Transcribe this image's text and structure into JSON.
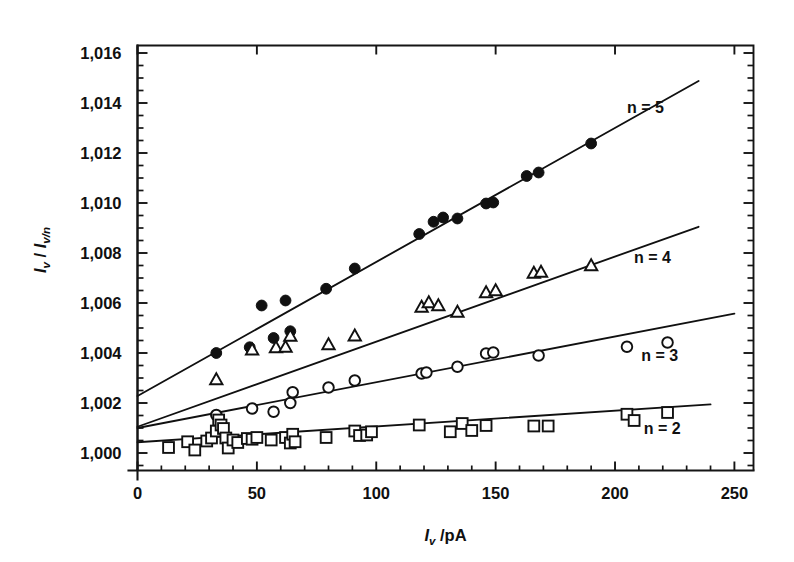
{
  "figure": {
    "background_color": "#ffffff",
    "ink_color": "#111111"
  },
  "axes": {
    "x_title": "I_v /pA",
    "x_title_parts": {
      "symbol": "I",
      "subscript": "v",
      "rest": "/pA"
    },
    "y_title": "I_v / I_v/n",
    "y_title_parts": {
      "symbol_a": "I",
      "sub_a": "v",
      "slash": "/",
      "symbol_b": "I",
      "sub_b": "v/n"
    },
    "x_ticklabels": [
      "0",
      "50",
      "100",
      "150",
      "200",
      "250"
    ],
    "x_tickvalues": [
      0,
      50,
      100,
      150,
      200,
      250
    ],
    "x_minor_step": 10,
    "xlim": [
      0,
      258
    ],
    "y_ticklabels": [
      "1,000",
      "1,002",
      "1,004",
      "1,006",
      "1,008",
      "1,010",
      "1,012",
      "1,014",
      "1,016"
    ],
    "y_tickvalues": [
      1.0,
      1.002,
      1.004,
      1.006,
      1.008,
      1.01,
      1.012,
      1.014,
      1.016
    ],
    "y_minor_step": 0.0005,
    "ylim": [
      0.9993,
      1.0163
    ],
    "decimal_separator": ","
  },
  "chart_data": {
    "type": "scatter",
    "title": "",
    "xlabel": "I_v /pA",
    "ylabel": "I_v / I_v/n",
    "xlim": [
      0,
      258
    ],
    "ylim": [
      0.9993,
      1.0163
    ],
    "grid": false,
    "legend_position": "inline-right",
    "series": [
      {
        "name": "n = 5",
        "label": "n = 5",
        "marker": "filled-circle",
        "label_x": 205,
        "label_y": 1.0136,
        "fit": {
          "intercept": 1.00228,
          "slope_per_pA": 5.362e-05,
          "x_start": 0,
          "x_end": 235
        },
        "points": [
          [
            33,
            1.004
          ],
          [
            47,
            1.00423
          ],
          [
            52,
            1.0059
          ],
          [
            57,
            1.0046
          ],
          [
            62,
            1.0061
          ],
          [
            64,
            1.00487
          ],
          [
            79,
            1.00657
          ],
          [
            91,
            1.00738
          ],
          [
            118,
            1.00876
          ],
          [
            124,
            1.00925
          ],
          [
            128,
            1.00942
          ],
          [
            134,
            1.00938
          ],
          [
            146,
            1.00998
          ],
          [
            149,
            1.01002
          ],
          [
            163,
            1.01108
          ],
          [
            168,
            1.01122
          ],
          [
            190,
            1.01238
          ]
        ]
      },
      {
        "name": "n = 4",
        "label": "n = 4",
        "marker": "open-triangle",
        "label_x": 208,
        "label_y": 1.0076,
        "fit": {
          "intercept": 1.00105,
          "slope_per_pA": 3.404e-05,
          "x_start": 0,
          "x_end": 235
        },
        "points": [
          [
            33,
            1.00292
          ],
          [
            48,
            1.00411
          ],
          [
            58,
            1.0042
          ],
          [
            62,
            1.00422
          ],
          [
            64,
            1.00466
          ],
          [
            80,
            1.00432
          ],
          [
            91,
            1.00467
          ],
          [
            119,
            1.00582
          ],
          [
            122,
            1.006
          ],
          [
            126,
            1.00588
          ],
          [
            134,
            1.00562
          ],
          [
            146,
            1.0064
          ],
          [
            150,
            1.00648
          ],
          [
            166,
            1.00718
          ],
          [
            169,
            1.00722
          ],
          [
            190,
            1.00748
          ]
        ]
      },
      {
        "name": "n = 3",
        "label": "n = 3",
        "marker": "open-circle",
        "label_x": 211,
        "label_y": 1.0037,
        "fit": {
          "intercept": 1.001,
          "slope_per_pA": 1.83e-05,
          "x_start": 0,
          "x_end": 250
        },
        "points": [
          [
            33,
            1.00152
          ],
          [
            48,
            1.00178
          ],
          [
            57,
            1.00165
          ],
          [
            64,
            1.002
          ],
          [
            65,
            1.00243
          ],
          [
            80,
            1.00262
          ],
          [
            91,
            1.0029
          ],
          [
            119,
            1.00318
          ],
          [
            121,
            1.00322
          ],
          [
            134,
            1.00345
          ],
          [
            146,
            1.00398
          ],
          [
            149,
            1.00402
          ],
          [
            168,
            1.0039
          ],
          [
            205,
            1.00425
          ],
          [
            222,
            1.00442
          ]
        ]
      },
      {
        "name": "n = 2",
        "label": "n = 2",
        "marker": "open-square",
        "label_x": 212,
        "label_y": 1.00078,
        "fit": {
          "intercept": 1.00043,
          "slope_per_pA": 6.32e-06,
          "x_start": 0,
          "x_end": 240
        },
        "points": [
          [
            13,
            1.00022
          ],
          [
            21,
            1.00045
          ],
          [
            24,
            1.00012
          ],
          [
            29,
            1.00048
          ],
          [
            31,
            1.0006
          ],
          [
            33,
            1.00088
          ],
          [
            34,
            1.00132
          ],
          [
            35,
            1.00112
          ],
          [
            36,
            1.00098
          ],
          [
            37,
            1.0006
          ],
          [
            38,
            1.0002
          ],
          [
            40,
            1.00052
          ],
          [
            42,
            1.00042
          ],
          [
            46,
            1.00058
          ],
          [
            48,
            1.00055
          ],
          [
            50,
            1.00062
          ],
          [
            56,
            1.00052
          ],
          [
            62,
            1.00062
          ],
          [
            64,
            1.0004
          ],
          [
            65,
            1.00075
          ],
          [
            66,
            1.00045
          ],
          [
            79,
            1.00062
          ],
          [
            91,
            1.00088
          ],
          [
            93,
            1.0007
          ],
          [
            96,
            1.00072
          ],
          [
            98,
            1.00085
          ],
          [
            118,
            1.00112
          ],
          [
            131,
            1.00085
          ],
          [
            136,
            1.00118
          ],
          [
            140,
            1.0009
          ],
          [
            146,
            1.0011
          ],
          [
            166,
            1.00108
          ],
          [
            172,
            1.00108
          ],
          [
            205,
            1.00155
          ],
          [
            208,
            1.0013
          ],
          [
            222,
            1.00162
          ]
        ]
      }
    ]
  }
}
